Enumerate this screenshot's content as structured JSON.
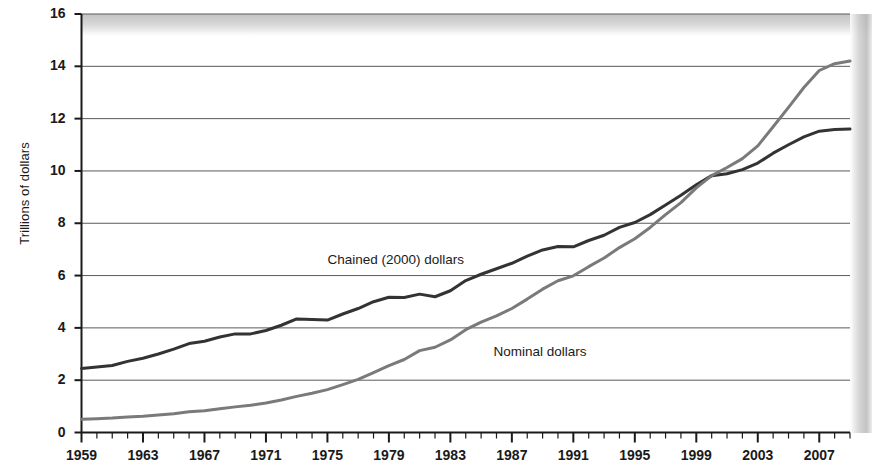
{
  "chart_data": {
    "type": "line",
    "title": "",
    "subtitle": "",
    "xlabel": "",
    "ylabel": "Trillions of dollars",
    "xlim": [
      1959,
      2009
    ],
    "ylim": [
      0,
      16
    ],
    "ytick_step": 2,
    "xtick_step": 4,
    "minor_xtick_step": 1,
    "grid": "horizontal",
    "legend": "inline-annotations",
    "yticks": [
      "0",
      "2",
      "4",
      "6",
      "8",
      "10",
      "12",
      "14",
      "16"
    ],
    "xticks": [
      "1959",
      "1963",
      "1967",
      "1971",
      "1975",
      "1979",
      "1983",
      "1987",
      "1991",
      "1995",
      "1999",
      "2003",
      "2007"
    ],
    "annotations": [
      {
        "name": "chained-dollars-label",
        "text": "Chained (2000) dollars",
        "x": 1975.0,
        "y": 6.55
      },
      {
        "name": "nominal-dollars-label",
        "text": "Nominal dollars",
        "x": 1985.8,
        "y": 3.05
      }
    ],
    "x": [
      1959,
      1960,
      1961,
      1962,
      1963,
      1964,
      1965,
      1966,
      1967,
      1968,
      1969,
      1970,
      1971,
      1972,
      1973,
      1974,
      1975,
      1976,
      1977,
      1978,
      1979,
      1980,
      1981,
      1982,
      1983,
      1984,
      1985,
      1986,
      1987,
      1988,
      1989,
      1990,
      1991,
      1992,
      1993,
      1994,
      1995,
      1996,
      1997,
      1998,
      1999,
      2000,
      2001,
      2002,
      2003,
      2004,
      2005,
      2006,
      2007,
      2008,
      2009
    ],
    "series": [
      {
        "name": "Chained (2000) dollars",
        "color": "#333333",
        "values": [
          2.45,
          2.5,
          2.56,
          2.72,
          2.84,
          3.0,
          3.19,
          3.4,
          3.49,
          3.65,
          3.77,
          3.77,
          3.9,
          4.1,
          4.34,
          4.32,
          4.3,
          4.53,
          4.74,
          5.0,
          5.17,
          5.16,
          5.29,
          5.19,
          5.42,
          5.81,
          6.05,
          6.26,
          6.47,
          6.74,
          6.98,
          7.11,
          7.1,
          7.34,
          7.54,
          7.84,
          8.03,
          8.33,
          8.7,
          9.07,
          9.47,
          9.82,
          9.89,
          10.05,
          10.3,
          10.68,
          11.0,
          11.3,
          11.52,
          11.58,
          11.6
        ]
      },
      {
        "name": "Nominal dollars",
        "color": "#7a7a7a",
        "values": [
          0.51,
          0.53,
          0.55,
          0.59,
          0.62,
          0.67,
          0.72,
          0.79,
          0.83,
          0.91,
          0.98,
          1.04,
          1.13,
          1.24,
          1.38,
          1.5,
          1.64,
          1.83,
          2.03,
          2.29,
          2.56,
          2.79,
          3.13,
          3.26,
          3.54,
          3.93,
          4.22,
          4.46,
          4.74,
          5.1,
          5.48,
          5.8,
          5.99,
          6.34,
          6.67,
          7.07,
          7.41,
          7.84,
          8.33,
          8.79,
          9.35,
          9.82,
          10.13,
          10.47,
          10.96,
          11.69,
          12.43,
          13.19,
          13.84,
          14.1,
          14.2
        ]
      }
    ]
  }
}
